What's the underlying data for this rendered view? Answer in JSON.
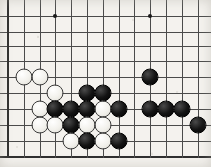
{
  "board": {
    "title": "Go board position",
    "game": "Go (Weiqi/Baduk)",
    "view": "partial board crop",
    "background_color": "#f4f2ee",
    "line_color": "#4b4b4b",
    "edge_color": "#2e2e2e",
    "black_color": "#141414",
    "white_color": "#f2f1ec",
    "geometry": {
      "width": 211,
      "height": 167,
      "cell_size": 15.8,
      "stone_diameter": 17,
      "column_x": [
        8,
        24,
        40,
        55,
        71,
        87,
        103,
        119,
        134,
        150,
        166,
        182,
        198
      ],
      "row_y": [
        16,
        32,
        46,
        61,
        77,
        93,
        109,
        125,
        141,
        157
      ],
      "left_edge_x": 8,
      "bottom_edge_y": 157,
      "columns": 13,
      "rows": 10
    },
    "star_points": [
      {
        "col": 3,
        "row": 0,
        "x": 55,
        "y": 16
      },
      {
        "col": 9,
        "row": 0,
        "x": 150,
        "y": 16
      }
    ],
    "edges": {
      "left": true,
      "bottom": true,
      "top": false,
      "right": false
    },
    "stones": [
      {
        "color": "white",
        "col": 1,
        "row": 4,
        "x": 24,
        "y": 77
      },
      {
        "color": "white",
        "col": 2,
        "row": 4,
        "x": 40,
        "y": 77
      },
      {
        "color": "white",
        "col": 3,
        "row": 5,
        "x": 55,
        "y": 93
      },
      {
        "color": "black",
        "col": 5,
        "row": 5,
        "x": 87,
        "y": 93
      },
      {
        "color": "black",
        "col": 6,
        "row": 5,
        "x": 103,
        "y": 93
      },
      {
        "color": "black",
        "col": 9,
        "row": 4,
        "x": 150,
        "y": 77
      },
      {
        "color": "white",
        "col": 2,
        "row": 6,
        "x": 40,
        "y": 109
      },
      {
        "color": "black",
        "col": 3,
        "row": 6,
        "x": 55,
        "y": 109
      },
      {
        "color": "black",
        "col": 4,
        "row": 6,
        "x": 71,
        "y": 109
      },
      {
        "color": "black",
        "col": 5,
        "row": 6,
        "x": 87,
        "y": 109
      },
      {
        "color": "white",
        "col": 6,
        "row": 6,
        "x": 103,
        "y": 109
      },
      {
        "color": "black",
        "col": 7,
        "row": 6,
        "x": 119,
        "y": 109
      },
      {
        "color": "black",
        "col": 9,
        "row": 6,
        "x": 150,
        "y": 109
      },
      {
        "color": "black",
        "col": 10,
        "row": 6,
        "x": 166,
        "y": 109
      },
      {
        "color": "black",
        "col": 11,
        "row": 6,
        "x": 182,
        "y": 109
      },
      {
        "color": "white",
        "col": 2,
        "row": 7,
        "x": 40,
        "y": 125
      },
      {
        "color": "white",
        "col": 3,
        "row": 7,
        "x": 55,
        "y": 125
      },
      {
        "color": "black",
        "col": 4,
        "row": 7,
        "x": 71,
        "y": 125
      },
      {
        "color": "white",
        "col": 5,
        "row": 7,
        "x": 87,
        "y": 125
      },
      {
        "color": "white",
        "col": 6,
        "row": 7,
        "x": 103,
        "y": 125
      },
      {
        "color": "black",
        "col": 12,
        "row": 7,
        "x": 198,
        "y": 125
      },
      {
        "color": "white",
        "col": 4,
        "row": 8,
        "x": 71,
        "y": 141
      },
      {
        "color": "black",
        "col": 5,
        "row": 8,
        "x": 87,
        "y": 141
      },
      {
        "color": "white",
        "col": 6,
        "row": 8,
        "x": 103,
        "y": 141
      },
      {
        "color": "black",
        "col": 7,
        "row": 8,
        "x": 119,
        "y": 141
      }
    ],
    "counts": {
      "black_stones": 15,
      "white_stones": 11,
      "total_stones": 26
    }
  }
}
